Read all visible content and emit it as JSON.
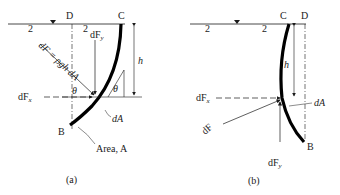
{
  "figure_a": {
    "caption": "(a)",
    "point_labels": {
      "D": "D",
      "C": "C",
      "B": "B"
    },
    "height_label": "h",
    "force_labels": {
      "dF_eq": "dF = ρgh dA",
      "dFy": "dF",
      "dFy_sub": "y",
      "dFx": "dF",
      "dFx_sub": "x",
      "dA": "dA",
      "area": "Area, A"
    },
    "angle_label": "θ"
  },
  "figure_b": {
    "caption": "(b)",
    "point_labels": {
      "C": "C",
      "D": "D",
      "B": "B"
    },
    "height_label": "h",
    "force_labels": {
      "dFx": "dF",
      "dFx_sub": "x",
      "dF": "dF",
      "dA": "dA",
      "dFy": "dF",
      "dFy_sub": "y"
    }
  },
  "colors": {
    "ink": "#1a1a1a",
    "background": "#ffffff"
  }
}
